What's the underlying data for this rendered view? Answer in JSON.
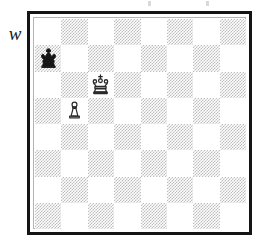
{
  "diagram": {
    "kind": "chess-diagram",
    "side_to_move_label": "w",
    "side_to_move_meaning": "White to move",
    "board": {
      "files": [
        "a",
        "b",
        "c",
        "d",
        "e",
        "f",
        "g",
        "h"
      ],
      "ranks": [
        "8",
        "7",
        "6",
        "5",
        "4",
        "3",
        "2",
        "1"
      ],
      "orientation": "white-at-bottom",
      "light_square_color": "#ffffff",
      "dark_square_color": "#bdbdbd",
      "border_color": "#141414",
      "inner_rule_color": "#b4b4b4",
      "dark_square_fill_style": "dithered-halftone"
    },
    "pieces": [
      {
        "piece": "king",
        "color": "black",
        "square": "a7",
        "file_index": 0,
        "rank_index": 1,
        "icon": "black-king-icon",
        "glyph": "♚"
      },
      {
        "piece": "king",
        "color": "white",
        "square": "c6",
        "file_index": 2,
        "rank_index": 2,
        "icon": "white-king-icon",
        "glyph": "♔"
      },
      {
        "piece": "pawn",
        "color": "white",
        "square": "b5",
        "file_index": 1,
        "rank_index": 3,
        "icon": "white-pawn-icon",
        "glyph": "♙"
      }
    ],
    "fen": "8/k7/2K5/1P6/8/8/8/8 w - - 0 1",
    "artifacts": {
      "top_edge_specks": 2
    }
  }
}
